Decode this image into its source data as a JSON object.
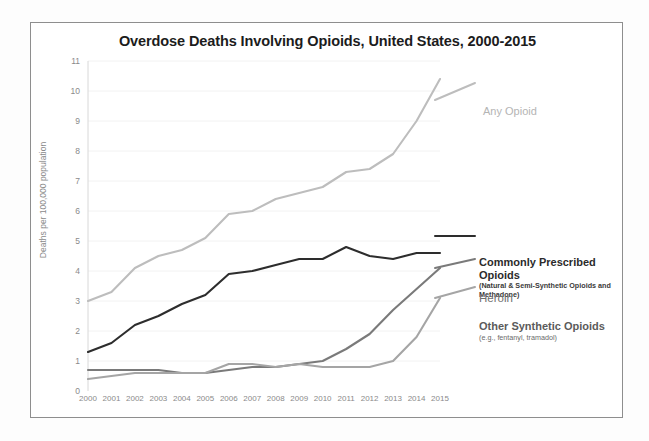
{
  "figure": {
    "title": "Overdose Deaths Involving Opioids, United States, 2000-2015",
    "background_color": "#ffffff",
    "frame_color": "#8e8e8e"
  },
  "axes": {
    "y_axis_label": "Deaths per 100,000 population",
    "y_ticks": [
      "0",
      "1",
      "2",
      "3",
      "4",
      "5",
      "6",
      "7",
      "8",
      "9",
      "10",
      "11"
    ],
    "x_ticks": [
      "2000",
      "2001",
      "2002",
      "2003",
      "2004",
      "2005",
      "2006",
      "2007",
      "2008",
      "2009",
      "2010",
      "2011",
      "2012",
      "2013",
      "2014",
      "2015"
    ]
  },
  "series_labels": {
    "any_opioid": "Any Opioid",
    "commonly_prescribed": "Commonly Prescribed Opioids",
    "commonly_prescribed_sub": "(Natural & Semi-Synthetic Opioids and Methadone)",
    "heroin": "Heroin",
    "other_synthetic": "Other Synthetic Opioids",
    "other_synthetic_sub": "(e.g., fentanyl, tramadol)"
  },
  "chart_data": {
    "type": "line",
    "title": "Overdose Deaths Involving Opioids, United States, 2000-2015",
    "xlabel": "",
    "ylabel": "Deaths per 100,000 population",
    "xlim": [
      2000,
      2015
    ],
    "ylim": [
      0,
      11
    ],
    "grid": true,
    "legend_position": "right-inline-annotations",
    "x": [
      2000,
      2001,
      2002,
      2003,
      2004,
      2005,
      2006,
      2007,
      2008,
      2009,
      2010,
      2011,
      2012,
      2013,
      2014,
      2015
    ],
    "series": [
      {
        "name": "Any Opioid",
        "color": "#bdbdbd",
        "values": [
          3.0,
          3.3,
          4.1,
          4.5,
          4.7,
          5.1,
          5.9,
          6.0,
          6.4,
          6.6,
          6.8,
          7.3,
          7.4,
          7.9,
          9.0,
          10.4
        ]
      },
      {
        "name": "Commonly Prescribed Opioids",
        "sublabel": "(Natural & Semi-Synthetic Opioids and Methadone)",
        "color": "#2d2d2d",
        "values": [
          1.3,
          1.6,
          2.2,
          2.5,
          2.9,
          3.2,
          3.9,
          4.0,
          4.2,
          4.4,
          4.4,
          4.8,
          4.5,
          4.4,
          4.6,
          4.6
        ]
      },
      {
        "name": "Heroin",
        "color": "#7a7a7a",
        "values": [
          0.7,
          0.7,
          0.7,
          0.7,
          0.6,
          0.6,
          0.7,
          0.8,
          0.8,
          0.9,
          1.0,
          1.4,
          1.9,
          2.7,
          3.4,
          4.1
        ]
      },
      {
        "name": "Other Synthetic Opioids",
        "sublabel": "(e.g., fentanyl, tramadol)",
        "color": "#a5a5a5",
        "values": [
          0.4,
          0.5,
          0.6,
          0.6,
          0.6,
          0.6,
          0.9,
          0.9,
          0.8,
          0.9,
          0.8,
          0.8,
          0.8,
          1.0,
          1.8,
          3.1
        ]
      }
    ]
  }
}
